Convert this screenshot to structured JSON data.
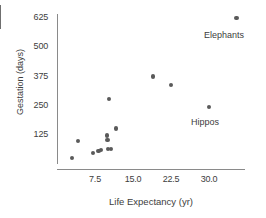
{
  "chart_data": {
    "type": "scatter",
    "title": "",
    "xlabel": "Life Expectancy (yr)",
    "ylabel": "Gestation (days)",
    "xlim": [
      2.0,
      37.0
    ],
    "ylim": [
      0,
      680
    ],
    "xticks": [
      7.5,
      15.0,
      22.5,
      30.0
    ],
    "xtick_labels": [
      "7.5",
      "15.0",
      "22.5",
      "30.0"
    ],
    "yticks": [
      125,
      250,
      375,
      500,
      625
    ],
    "ytick_labels": [
      "125",
      "250",
      "375",
      "500",
      "625"
    ],
    "grid": false,
    "legend": null,
    "marker_color": "#5a5a5a",
    "axis_color": "#8a8a8a",
    "points": [
      {
        "x": 3.0,
        "y": 22,
        "label": ""
      },
      {
        "x": 4.2,
        "y": 96,
        "label": ""
      },
      {
        "x": 7.1,
        "y": 44,
        "label": ""
      },
      {
        "x": 8.2,
        "y": 52,
        "label": ""
      },
      {
        "x": 8.7,
        "y": 56,
        "label": ""
      },
      {
        "x": 9.9,
        "y": 118,
        "label": ""
      },
      {
        "x": 10.0,
        "y": 100,
        "label": ""
      },
      {
        "x": 10.1,
        "y": 62,
        "label": ""
      },
      {
        "x": 10.6,
        "y": 62,
        "label": ""
      },
      {
        "x": 10.3,
        "y": 275,
        "label": ""
      },
      {
        "x": 11.6,
        "y": 148,
        "label": ""
      },
      {
        "x": 19.0,
        "y": 370,
        "label": ""
      },
      {
        "x": 22.5,
        "y": 335,
        "label": ""
      },
      {
        "x": 30.0,
        "y": 240,
        "label": "Hippos"
      },
      {
        "x": 35.4,
        "y": 622,
        "label": "Elephants"
      }
    ],
    "annotations": [
      {
        "text": "Elephants",
        "x_px": 204,
        "y_px": 30
      },
      {
        "text": "Hippos",
        "x_px": 191,
        "y_px": 117
      }
    ]
  }
}
